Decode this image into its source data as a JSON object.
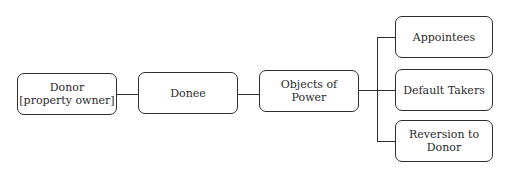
{
  "diagram": {
    "nodes": {
      "donor": {
        "label": "Donor\n[property owner]"
      },
      "donee": {
        "label": "Donee"
      },
      "objects": {
        "label": "Objects of\nPower"
      },
      "appointees": {
        "label": "Appointees"
      },
      "default_takers": {
        "label": "Default Takers"
      },
      "reversion": {
        "label": "Reversion to\nDonor"
      }
    },
    "edges": [
      [
        "donor",
        "donee"
      ],
      [
        "donee",
        "objects"
      ],
      [
        "objects",
        "appointees"
      ],
      [
        "objects",
        "default_takers"
      ],
      [
        "objects",
        "reversion"
      ]
    ]
  }
}
